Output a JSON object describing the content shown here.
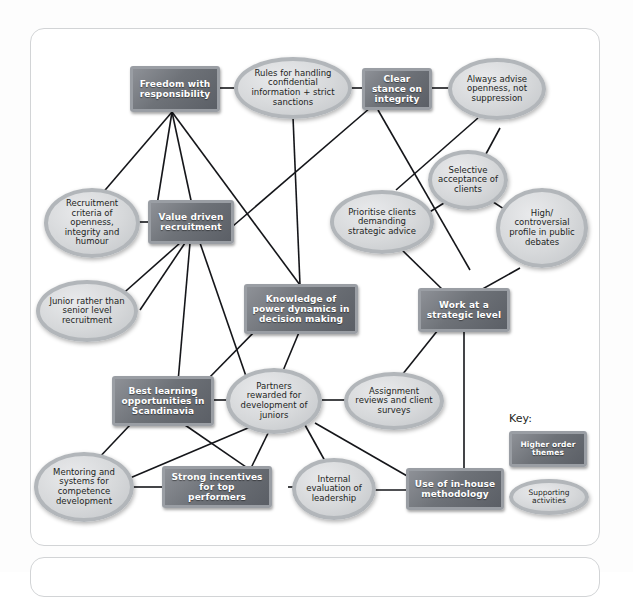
{
  "diagram": {
    "legend": {
      "label": "Key:",
      "theme_label": "Higher order themes",
      "support_label": "Supporting activities"
    },
    "colors": {
      "theme_fill": "#6e7278",
      "theme_border": "#9a9ea4",
      "theme_text": "#ffffff",
      "support_fill": "#d6d8da",
      "support_border": "#b2b6ba",
      "support_text": "#1d1f23",
      "connector": "#15161a",
      "panel_border": "#d2d4d6",
      "page_background": "#ffffff"
    },
    "nodes": [
      {
        "id": "freedom",
        "type": "theme",
        "label": "Freedom with responsibility"
      },
      {
        "id": "rules",
        "type": "support",
        "label": "Rules for handling confidential information + strict sanctions"
      },
      {
        "id": "clear",
        "type": "theme",
        "label": "Clear stance on integrity"
      },
      {
        "id": "always",
        "type": "support",
        "label": "Always advise openness, not suppression"
      },
      {
        "id": "selective",
        "type": "support",
        "label": "Selective acceptance of clients"
      },
      {
        "id": "recruitcrit",
        "type": "support",
        "label": "Recruitment criteria of openness, integrity and humour"
      },
      {
        "id": "valuedriven",
        "type": "theme",
        "label": "Value driven recruitment"
      },
      {
        "id": "prioritise",
        "type": "support",
        "label": "Prioritise clients demanding strategic advice"
      },
      {
        "id": "highprofile",
        "type": "support",
        "label": "High/ controversial profile in public debates"
      },
      {
        "id": "junior",
        "type": "support",
        "label": "Junior rather than senior level recruitment"
      },
      {
        "id": "knowledge",
        "type": "theme",
        "label": "Knowledge of power dynamics in decision making"
      },
      {
        "id": "strategic",
        "type": "theme",
        "label": "Work at a strategic level"
      },
      {
        "id": "bestlearn",
        "type": "theme",
        "label": "Best learning opportunities in Scandinavia"
      },
      {
        "id": "partners",
        "type": "support",
        "label": "Partners rewarded for development of juniors"
      },
      {
        "id": "assignment",
        "type": "support",
        "label": "Assignment reviews and client surveys"
      },
      {
        "id": "mentoring",
        "type": "support",
        "label": "Mentoring and systems for competence development"
      },
      {
        "id": "incentives",
        "type": "theme",
        "label": "Strong incentives for top performers"
      },
      {
        "id": "internal",
        "type": "support",
        "label": "Internal evaluation of leadership"
      },
      {
        "id": "inhouse",
        "type": "theme",
        "label": "Use of in-house methodology"
      }
    ]
  }
}
